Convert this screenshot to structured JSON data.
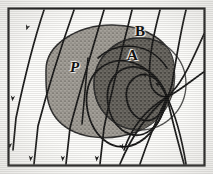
{
  "figure": {
    "kind": "scanned-line-diagram",
    "frame": {
      "x": 8,
      "y": 8,
      "width": 197,
      "height": 158,
      "stroke": "#1a1a1a",
      "stroke_width": 2.2
    },
    "background": "#fdfdfb",
    "ink_color": "#141414"
  },
  "labels": [
    {
      "id": "P",
      "text": "P",
      "x": 70,
      "y": 60,
      "meaning": "plasma-region-label"
    },
    {
      "id": "A",
      "text": "A",
      "x": 127,
      "y": 48,
      "meaning": "inner-region-label"
    },
    {
      "id": "B",
      "text": "B",
      "x": 135,
      "y": 24,
      "meaning": "boundary-label"
    }
  ],
  "regions": [
    {
      "name": "plasma-blob",
      "label": "P",
      "fill": "#9e9a93",
      "stroke": "#2a2a2a",
      "path": "M 46 70 C 46 44, 78 25, 112 25 C 146 25, 172 42, 174 66 C 177 92, 168 120, 136 132 C 106 143, 72 138, 56 118 C 45 104, 46 86, 46 70 Z"
    },
    {
      "name": "inner-dark-circle",
      "label": "A",
      "fill": "#5d5a55",
      "stroke": "#242424",
      "cx": 140,
      "cy": 84,
      "rx": 45,
      "ry": 45
    }
  ],
  "field_lines": {
    "name": "magnetic-field-lines",
    "direction": "downward-left",
    "count": 8,
    "arrow_heads": 9,
    "paths": [
      "M 44 10 C 34 40, 24 80, 16 118 L 13 150",
      "M 74 10 C 62 44, 48 88, 38 126 L 34 164",
      "M 104 10 C 94 44, 80 90, 70 128 L 66 164",
      "M 132 10 C 124 42, 112 88, 104 128 L 100 164",
      "M 160 10 C 152 40, 146 72, 152 88 C 157 96, 162 97, 167 97",
      "M 186 10 C 180 34, 176 60, 172 84 C 170 92, 168 96, 167 97",
      "M 204 34 C 196 52, 184 80, 172 92 C 170 95, 168 97, 167 97",
      "M 204 72 C 192 80, 178 92, 167 97"
    ],
    "outflow_paths": [
      "M 167 97 C 160 112, 150 134, 140 164",
      "M 167 97 C 152 110, 134 130, 120 164",
      "M 167 97 C 148 108, 132 126, 124 150",
      "M 167 97 C 176 116, 182 140, 186 164",
      "M 167 97 C 172 120, 178 142, 184 164"
    ],
    "separatrix_paths": [
      "M 167 97 C 150 60, 118 52, 98 70 C 80 86, 84 124, 104 140 C 126 158, 158 140, 167 97",
      "M 167 97 C 156 66, 130 60, 116 74 C 102 88, 106 118, 122 130 C 142 144, 162 128, 167 97",
      "M 167 97 C 160 74, 142 70, 132 80 C 122 90, 126 110, 138 118 C 152 126, 164 114, 167 97"
    ],
    "boundary_arc_B": "M 98 58 C 118 40, 150 42, 167 68",
    "short_tick": "M 88 58 C 86 80, 84 104, 82 124"
  },
  "arrow_markers": [
    {
      "x": 31,
      "y": 26,
      "angle": 108
    },
    {
      "x": 16,
      "y": 96,
      "angle": 96
    },
    {
      "x": 13,
      "y": 143,
      "angle": 92
    },
    {
      "x": 34,
      "y": 156,
      "angle": 95
    },
    {
      "x": 66,
      "y": 156,
      "angle": 94
    },
    {
      "x": 100,
      "y": 156,
      "angle": 93
    },
    {
      "x": 124,
      "y": 143,
      "angle": 70
    },
    {
      "x": 146,
      "y": 78,
      "angle": 196
    },
    {
      "x": 158,
      "y": 88,
      "angle": 212
    }
  ]
}
